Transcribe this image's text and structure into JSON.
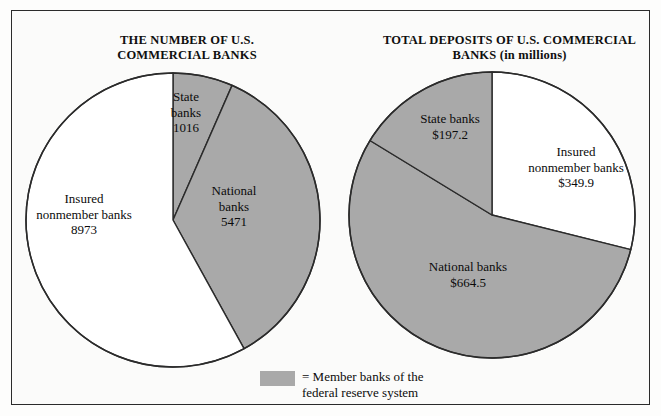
{
  "figure": {
    "width": 661,
    "height": 416,
    "background": "#fbfbfa",
    "border_color": "#2b2b2b",
    "member_fill": "#a9a9a9",
    "nonmember_fill": "#ffffff",
    "stroke_color": "#2b2b2b"
  },
  "legend": {
    "swatch_color": "#a9a9a9",
    "text": "= Member banks of the\n   federal reserve system"
  },
  "chart_data": [
    {
      "type": "pie",
      "id": "number-of-banks",
      "title": "THE NUMBER OF U.S.\nCOMMERCIAL BANKS",
      "title_line1": "THE NUMBER OF U.S.",
      "title_line2": "COMMERCIAL BANKS",
      "unit": "count",
      "total": 15460,
      "categories": [
        "State banks",
        "National banks",
        "Insured nonmember banks"
      ],
      "values": [
        1016,
        5471,
        8973
      ],
      "slices": [
        {
          "name": "State banks",
          "value": 1016,
          "value_label": "1016",
          "label": "State\nbanks\n1016",
          "percent": 6.6,
          "start_angle_deg": 0,
          "end_angle_deg": 23.7,
          "fill": "#a9a9a9",
          "member": true
        },
        {
          "name": "National banks",
          "value": 5471,
          "value_label": "5471",
          "label": "National\nbanks\n5471",
          "percent": 35.4,
          "start_angle_deg": 23.7,
          "end_angle_deg": 151.1,
          "fill": "#a9a9a9",
          "member": true
        },
        {
          "name": "Insured nonmember banks",
          "value": 8973,
          "value_label": "8973",
          "label": "Insured\nnonmember banks\n8973",
          "percent": 58.0,
          "start_angle_deg": 151.1,
          "end_angle_deg": 360,
          "fill": "#ffffff",
          "member": false
        }
      ]
    },
    {
      "type": "pie",
      "id": "total-deposits",
      "title": "TOTAL DEPOSITS OF U.S.\nCOMMERCIAL BANKS (in millions)",
      "title_line1": "TOTAL DEPOSITS OF U.S.",
      "title_line2": "COMMERCIAL BANKS (in millions)",
      "unit": "millions of dollars",
      "total": 1211.6,
      "categories": [
        "Insured nonmember banks",
        "National banks",
        "State banks"
      ],
      "values": [
        349.9,
        664.5,
        197.2
      ],
      "slices": [
        {
          "name": "Insured nonmember banks",
          "value": 349.9,
          "value_label": "$349.9",
          "label": "Insured\nnonmember banks\n$349.9",
          "percent": 28.9,
          "start_angle_deg": 0,
          "end_angle_deg": 104.0,
          "fill": "#ffffff",
          "member": false
        },
        {
          "name": "National banks",
          "value": 664.5,
          "value_label": "$664.5",
          "label": "National banks\n$664.5",
          "percent": 54.8,
          "start_angle_deg": 104.0,
          "end_angle_deg": 301.4,
          "fill": "#a9a9a9",
          "member": true
        },
        {
          "name": "State banks",
          "value": 197.2,
          "value_label": "$197.2",
          "label": "State banks\n$197.2",
          "percent": 16.3,
          "start_angle_deg": 301.4,
          "end_angle_deg": 360,
          "fill": "#a9a9a9",
          "member": true
        }
      ]
    }
  ]
}
